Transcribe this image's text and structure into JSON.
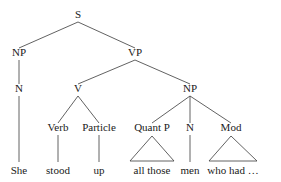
{
  "diagram": {
    "type": "syntax-tree",
    "title": "",
    "sentence": "She stood up all those men who had ...",
    "colors": {
      "background": "#ffffff",
      "line": "#3a3a3a",
      "text": "#1a1a1a"
    },
    "nodes": [
      {
        "id": "S",
        "label": "S",
        "x": 78,
        "y": 18,
        "level": 0
      },
      {
        "id": "NP1",
        "label": "NP",
        "x": 19,
        "y": 56,
        "level": 1
      },
      {
        "id": "VP",
        "label": "VP",
        "x": 135,
        "y": 56,
        "level": 1
      },
      {
        "id": "N1",
        "label": "N",
        "x": 19,
        "y": 92,
        "level": 2
      },
      {
        "id": "V",
        "label": "V",
        "x": 78,
        "y": 92,
        "level": 2
      },
      {
        "id": "NP2",
        "label": "NP",
        "x": 190,
        "y": 92,
        "level": 2
      },
      {
        "id": "Verb",
        "label": "Verb",
        "x": 58,
        "y": 131,
        "level": 3
      },
      {
        "id": "Particle",
        "label": "Particle",
        "x": 99,
        "y": 131,
        "level": 3
      },
      {
        "id": "QuantP",
        "label": "Quant P",
        "x": 152,
        "y": 131,
        "level": 3
      },
      {
        "id": "N2",
        "label": "N",
        "x": 190,
        "y": 131,
        "level": 3
      },
      {
        "id": "Mod",
        "label": "Mod",
        "x": 231,
        "y": 131,
        "level": 3
      }
    ],
    "edges": [
      {
        "from": "S",
        "to": "NP1"
      },
      {
        "from": "S",
        "to": "VP"
      },
      {
        "from": "NP1",
        "to": "N1"
      },
      {
        "from": "VP",
        "to": "V"
      },
      {
        "from": "VP",
        "to": "NP2"
      },
      {
        "from": "V",
        "to": "Verb"
      },
      {
        "from": "V",
        "to": "Particle"
      },
      {
        "from": "NP2",
        "to": "QuantP"
      },
      {
        "from": "NP2",
        "to": "N2"
      },
      {
        "from": "NP2",
        "to": "Mod"
      }
    ],
    "leaves": [
      {
        "id": "w-she",
        "text": "She",
        "x": 19,
        "y": 174,
        "parent": "N1",
        "connector": "line"
      },
      {
        "id": "w-stood",
        "text": "stood",
        "x": 58,
        "y": 174,
        "parent": "Verb",
        "connector": "line"
      },
      {
        "id": "w-up",
        "text": "up",
        "x": 99,
        "y": 174,
        "parent": "Particle",
        "connector": "line"
      },
      {
        "id": "w-all",
        "text": "all those",
        "x": 152,
        "y": 174,
        "parent": "QuantP",
        "connector": "triangle",
        "half_width": 22
      },
      {
        "id": "w-men",
        "text": "men",
        "x": 190,
        "y": 174,
        "parent": "N2",
        "connector": "line"
      },
      {
        "id": "w-who",
        "text": "who had …",
        "x": 233,
        "y": 174,
        "parent": "Mod",
        "connector": "triangle",
        "half_width": 24
      }
    ],
    "geometry": {
      "node_bottom_offset": 4,
      "child_top_offset": 8,
      "leaf_top": 162,
      "triangle_base_y": 161
    }
  }
}
